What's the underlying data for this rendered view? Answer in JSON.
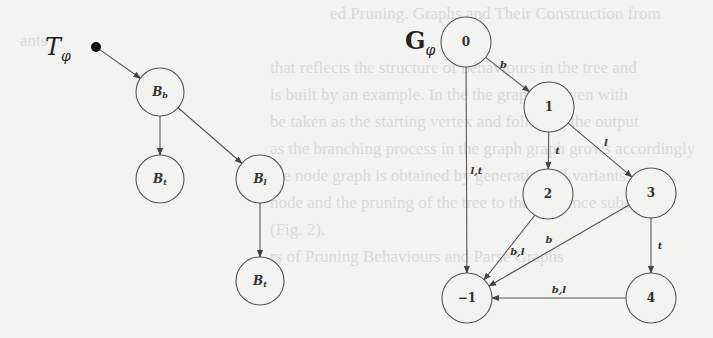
{
  "colors": {
    "background": "#f3f3f1",
    "stroke": "#555555",
    "text": "#333333"
  },
  "tree": {
    "title": "T",
    "title_subscript": "φ",
    "root": {
      "x": 96,
      "y": 47
    },
    "nodes": [
      {
        "id": "Bb",
        "label": "B",
        "sub": "b",
        "x": 160,
        "y": 92
      },
      {
        "id": "Bt1",
        "label": "B",
        "sub": "t",
        "x": 160,
        "y": 179
      },
      {
        "id": "Bl",
        "label": "B",
        "sub": "l",
        "x": 260,
        "y": 179
      },
      {
        "id": "Bt2",
        "label": "B",
        "sub": "t",
        "x": 260,
        "y": 281
      }
    ],
    "edges": [
      {
        "from": "root",
        "to": "Bb"
      },
      {
        "from": "Bb",
        "to": "Bt1"
      },
      {
        "from": "Bb",
        "to": "Bl"
      },
      {
        "from": "Bl",
        "to": "Bt2"
      }
    ]
  },
  "graph": {
    "title": "G",
    "title_subscript": "φ",
    "nodes": [
      {
        "id": "0",
        "label": "0",
        "x": 466,
        "y": 42
      },
      {
        "id": "1",
        "label": "1",
        "x": 549,
        "y": 107
      },
      {
        "id": "2",
        "label": "2",
        "x": 548,
        "y": 194
      },
      {
        "id": "3",
        "label": "3",
        "x": 651,
        "y": 193
      },
      {
        "id": "m1",
        "label": "−1",
        "x": 467,
        "y": 298
      },
      {
        "id": "4",
        "label": "4",
        "x": 651,
        "y": 298
      }
    ],
    "edges": [
      {
        "from": "0",
        "to": "1",
        "label": "b"
      },
      {
        "from": "0",
        "to": "m1",
        "label": "l,t"
      },
      {
        "from": "1",
        "to": "2",
        "label": "t"
      },
      {
        "from": "1",
        "to": "3",
        "label": "l"
      },
      {
        "from": "2",
        "to": "m1",
        "label": "b,l"
      },
      {
        "from": "3",
        "to": "m1",
        "label": "b"
      },
      {
        "from": "3",
        "to": "4",
        "label": "t"
      },
      {
        "from": "4",
        "to": "m1",
        "label": "b,l"
      }
    ]
  }
}
